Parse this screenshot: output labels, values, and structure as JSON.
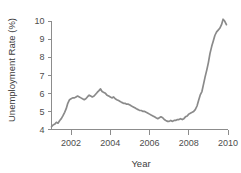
{
  "chart_data": {
    "type": "line",
    "title": "",
    "xlabel": "Year",
    "ylabel": "Unemployment Rate (%)",
    "xlim": [
      2001.0,
      2010.0
    ],
    "ylim": [
      4,
      10.5
    ],
    "xticks": [
      2002,
      2004,
      2006,
      2008,
      2010
    ],
    "xtick_labels": [
      "2002",
      "2004",
      "2006",
      "2008",
      "2010"
    ],
    "yticks": [
      4,
      5,
      6,
      7,
      8,
      9,
      10
    ],
    "ytick_labels": [
      "4",
      "5",
      "6",
      "7",
      "8",
      "9",
      "10"
    ],
    "grid": false,
    "legend": null,
    "series": [
      {
        "name": "Unemployment Rate",
        "color": "#8a8a8a",
        "x": [
          2001.0,
          2001.08,
          2001.17,
          2001.25,
          2001.33,
          2001.42,
          2001.5,
          2001.58,
          2001.67,
          2001.75,
          2001.83,
          2001.92,
          2002.0,
          2002.08,
          2002.17,
          2002.25,
          2002.33,
          2002.42,
          2002.5,
          2002.58,
          2002.67,
          2002.75,
          2002.83,
          2002.92,
          2003.0,
          2003.08,
          2003.17,
          2003.25,
          2003.33,
          2003.42,
          2003.5,
          2003.58,
          2003.67,
          2003.75,
          2003.83,
          2003.92,
          2004.0,
          2004.08,
          2004.17,
          2004.25,
          2004.33,
          2004.42,
          2004.5,
          2004.58,
          2004.67,
          2004.75,
          2004.83,
          2004.92,
          2005.0,
          2005.08,
          2005.17,
          2005.25,
          2005.33,
          2005.42,
          2005.5,
          2005.58,
          2005.67,
          2005.75,
          2005.83,
          2005.92,
          2006.0,
          2006.08,
          2006.17,
          2006.25,
          2006.33,
          2006.42,
          2006.5,
          2006.58,
          2006.67,
          2006.75,
          2006.83,
          2006.92,
          2007.0,
          2007.08,
          2007.17,
          2007.25,
          2007.33,
          2007.42,
          2007.5,
          2007.58,
          2007.67,
          2007.75,
          2007.83,
          2007.92,
          2008.0,
          2008.08,
          2008.17,
          2008.25,
          2008.33,
          2008.42,
          2008.5,
          2008.58,
          2008.67,
          2008.75,
          2008.83,
          2008.92,
          2009.0,
          2009.08,
          2009.17,
          2009.25,
          2009.33,
          2009.42,
          2009.5,
          2009.58,
          2009.67,
          2009.75,
          2009.83,
          2009.92
        ],
        "y": [
          4.15,
          4.25,
          4.3,
          4.4,
          4.35,
          4.5,
          4.6,
          4.75,
          4.95,
          5.15,
          5.45,
          5.65,
          5.7,
          5.75,
          5.75,
          5.8,
          5.85,
          5.8,
          5.75,
          5.7,
          5.65,
          5.7,
          5.8,
          5.9,
          5.85,
          5.8,
          5.85,
          5.95,
          6.05,
          6.15,
          6.25,
          6.1,
          6.05,
          6.0,
          5.9,
          5.85,
          5.8,
          5.75,
          5.8,
          5.7,
          5.65,
          5.6,
          5.55,
          5.5,
          5.45,
          5.45,
          5.4,
          5.4,
          5.35,
          5.3,
          5.25,
          5.2,
          5.15,
          5.1,
          5.05,
          5.05,
          5.0,
          5.0,
          4.95,
          4.9,
          4.85,
          4.8,
          4.75,
          4.7,
          4.65,
          4.6,
          4.65,
          4.7,
          4.65,
          4.55,
          4.5,
          4.45,
          4.45,
          4.5,
          4.45,
          4.5,
          4.5,
          4.55,
          4.55,
          4.6,
          4.55,
          4.6,
          4.7,
          4.75,
          4.85,
          4.9,
          4.95,
          5.0,
          5.1,
          5.3,
          5.6,
          5.9,
          6.1,
          6.5,
          6.9,
          7.3,
          7.7,
          8.2,
          8.6,
          8.9,
          9.2,
          9.4,
          9.5,
          9.6,
          9.8,
          10.1,
          10.0,
          9.8
        ]
      }
    ]
  },
  "axes": {
    "y_axis_name": "unemployment-rate-axis",
    "x_axis_name": "year-axis"
  }
}
